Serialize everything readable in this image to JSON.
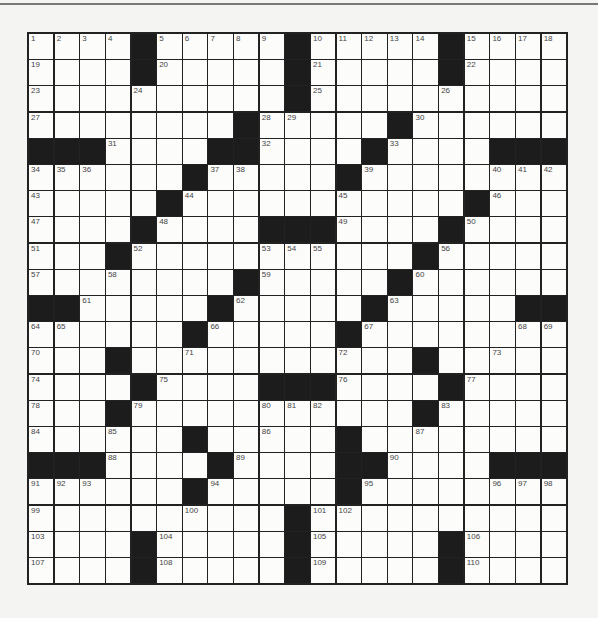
{
  "puzzle": {
    "rows": 21,
    "cols": 21,
    "colors": {
      "block": "#1c1c1c",
      "cell": "#fcfcfb",
      "line": "#222222",
      "background": "#f4f4f2",
      "number": "#444444"
    },
    "layout": [
      "....#.....#.....#....",
      "....#.....#.....#....",
      "..........#..........",
      "........#.....#......",
      "###....##....#....###",
      "......#.....#........",
      ".....#...........#...",
      "....#....###....#....",
      "...#...........#.....",
      "........#.....#......",
      "##.....#.....#.....##",
      "......#.....#........",
      "...#...........#.....",
      "....#....###....#....",
      "...#...........#.....",
      "......#.....#........",
      "###....#....##....###",
      "......#.....#........",
      "..........#..........",
      "....#.....#.....#....",
      "....#.....#.....#...."
    ],
    "numbers": [
      {
        "r": 0,
        "c": 0,
        "n": 1
      },
      {
        "r": 0,
        "c": 1,
        "n": 2
      },
      {
        "r": 0,
        "c": 2,
        "n": 3
      },
      {
        "r": 0,
        "c": 3,
        "n": 4
      },
      {
        "r": 0,
        "c": 5,
        "n": 5
      },
      {
        "r": 0,
        "c": 6,
        "n": 6
      },
      {
        "r": 0,
        "c": 7,
        "n": 7
      },
      {
        "r": 0,
        "c": 8,
        "n": 8
      },
      {
        "r": 0,
        "c": 9,
        "n": 9
      },
      {
        "r": 0,
        "c": 11,
        "n": 10
      },
      {
        "r": 0,
        "c": 12,
        "n": 11
      },
      {
        "r": 0,
        "c": 13,
        "n": 12
      },
      {
        "r": 0,
        "c": 14,
        "n": 13
      },
      {
        "r": 0,
        "c": 15,
        "n": 14
      },
      {
        "r": 0,
        "c": 17,
        "n": 15
      },
      {
        "r": 0,
        "c": 18,
        "n": 16
      },
      {
        "r": 0,
        "c": 19,
        "n": 17
      },
      {
        "r": 0,
        "c": 20,
        "n": 18
      },
      {
        "r": 1,
        "c": 0,
        "n": 19
      },
      {
        "r": 1,
        "c": 5,
        "n": 20
      },
      {
        "r": 1,
        "c": 11,
        "n": 21
      },
      {
        "r": 1,
        "c": 17,
        "n": 22
      },
      {
        "r": 2,
        "c": 0,
        "n": 23
      },
      {
        "r": 2,
        "c": 4,
        "n": 24
      },
      {
        "r": 2,
        "c": 11,
        "n": 25
      },
      {
        "r": 2,
        "c": 16,
        "n": 26
      },
      {
        "r": 3,
        "c": 0,
        "n": 27
      },
      {
        "r": 3,
        "c": 9,
        "n": 28
      },
      {
        "r": 3,
        "c": 10,
        "n": 29
      },
      {
        "r": 3,
        "c": 15,
        "n": 30
      },
      {
        "r": 4,
        "c": 3,
        "n": 31
      },
      {
        "r": 4,
        "c": 9,
        "n": 32
      },
      {
        "r": 4,
        "c": 14,
        "n": 33
      },
      {
        "r": 5,
        "c": 0,
        "n": 34
      },
      {
        "r": 5,
        "c": 1,
        "n": 35
      },
      {
        "r": 5,
        "c": 2,
        "n": 36
      },
      {
        "r": 5,
        "c": 7,
        "n": 37
      },
      {
        "r": 5,
        "c": 8,
        "n": 38
      },
      {
        "r": 5,
        "c": 13,
        "n": 39
      },
      {
        "r": 5,
        "c": 18,
        "n": 40
      },
      {
        "r": 5,
        "c": 19,
        "n": 41
      },
      {
        "r": 5,
        "c": 20,
        "n": 42
      },
      {
        "r": 6,
        "c": 0,
        "n": 43
      },
      {
        "r": 6,
        "c": 6,
        "n": 44
      },
      {
        "r": 6,
        "c": 12,
        "n": 45
      },
      {
        "r": 6,
        "c": 18,
        "n": 46
      },
      {
        "r": 7,
        "c": 0,
        "n": 47
      },
      {
        "r": 7,
        "c": 5,
        "n": 48
      },
      {
        "r": 7,
        "c": 12,
        "n": 49
      },
      {
        "r": 7,
        "c": 17,
        "n": 50
      },
      {
        "r": 8,
        "c": 0,
        "n": 51
      },
      {
        "r": 8,
        "c": 4,
        "n": 52
      },
      {
        "r": 8,
        "c": 9,
        "n": 53
      },
      {
        "r": 8,
        "c": 10,
        "n": 54
      },
      {
        "r": 8,
        "c": 11,
        "n": 55
      },
      {
        "r": 8,
        "c": 16,
        "n": 56
      },
      {
        "r": 9,
        "c": 0,
        "n": 57
      },
      {
        "r": 9,
        "c": 3,
        "n": 58
      },
      {
        "r": 9,
        "c": 9,
        "n": 59
      },
      {
        "r": 9,
        "c": 15,
        "n": 60
      },
      {
        "r": 10,
        "c": 2,
        "n": 61
      },
      {
        "r": 10,
        "c": 8,
        "n": 62
      },
      {
        "r": 10,
        "c": 14,
        "n": 63
      },
      {
        "r": 11,
        "c": 0,
        "n": 64
      },
      {
        "r": 11,
        "c": 1,
        "n": 65
      },
      {
        "r": 11,
        "c": 7,
        "n": 66
      },
      {
        "r": 11,
        "c": 13,
        "n": 67
      },
      {
        "r": 11,
        "c": 19,
        "n": 68
      },
      {
        "r": 11,
        "c": 20,
        "n": 69
      },
      {
        "r": 12,
        "c": 0,
        "n": 70
      },
      {
        "r": 12,
        "c": 6,
        "n": 71
      },
      {
        "r": 12,
        "c": 12,
        "n": 72
      },
      {
        "r": 12,
        "c": 18,
        "n": 73
      },
      {
        "r": 13,
        "c": 0,
        "n": 74
      },
      {
        "r": 13,
        "c": 5,
        "n": 75
      },
      {
        "r": 13,
        "c": 12,
        "n": 76
      },
      {
        "r": 13,
        "c": 17,
        "n": 77
      },
      {
        "r": 14,
        "c": 0,
        "n": 78
      },
      {
        "r": 14,
        "c": 4,
        "n": 79
      },
      {
        "r": 14,
        "c": 9,
        "n": 80
      },
      {
        "r": 14,
        "c": 10,
        "n": 81
      },
      {
        "r": 14,
        "c": 11,
        "n": 82
      },
      {
        "r": 14,
        "c": 16,
        "n": 83
      },
      {
        "r": 15,
        "c": 0,
        "n": 84
      },
      {
        "r": 15,
        "c": 3,
        "n": 85
      },
      {
        "r": 15,
        "c": 9,
        "n": 86
      },
      {
        "r": 15,
        "c": 15,
        "n": 87
      },
      {
        "r": 16,
        "c": 3,
        "n": 88
      },
      {
        "r": 16,
        "c": 8,
        "n": 89
      },
      {
        "r": 16,
        "c": 14,
        "n": 90
      },
      {
        "r": 17,
        "c": 0,
        "n": 91
      },
      {
        "r": 17,
        "c": 1,
        "n": 92
      },
      {
        "r": 17,
        "c": 2,
        "n": 93
      },
      {
        "r": 17,
        "c": 7,
        "n": 94
      },
      {
        "r": 17,
        "c": 13,
        "n": 95
      },
      {
        "r": 17,
        "c": 18,
        "n": 96
      },
      {
        "r": 17,
        "c": 19,
        "n": 97
      },
      {
        "r": 17,
        "c": 20,
        "n": 98
      },
      {
        "r": 18,
        "c": 0,
        "n": 99
      },
      {
        "r": 18,
        "c": 6,
        "n": 100
      },
      {
        "r": 18,
        "c": 11,
        "n": 101
      },
      {
        "r": 18,
        "c": 12,
        "n": 102
      },
      {
        "r": 19,
        "c": 0,
        "n": 103
      },
      {
        "r": 19,
        "c": 5,
        "n": 104
      },
      {
        "r": 19,
        "c": 11,
        "n": 105
      },
      {
        "r": 19,
        "c": 17,
        "n": 106
      },
      {
        "r": 20,
        "c": 0,
        "n": 107
      },
      {
        "r": 20,
        "c": 5,
        "n": 108
      },
      {
        "r": 20,
        "c": 11,
        "n": 109
      },
      {
        "r": 20,
        "c": 17,
        "n": 110
      }
    ],
    "entries": []
  }
}
